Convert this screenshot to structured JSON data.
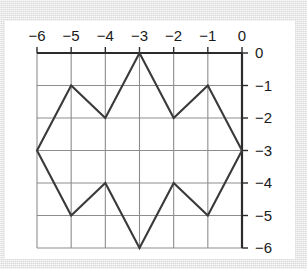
{
  "figure": {
    "background_color": "#ffffff",
    "page_background_color": "#e6e6e7",
    "grid_color": "#8d8d8d",
    "axis_color": "#2b2b2b",
    "polygon_color": "#3a3a3a"
  },
  "chart_data": {
    "type": "line",
    "title": "",
    "xlabel": "",
    "ylabel": "",
    "xlim": [
      -6,
      0
    ],
    "ylim": [
      -6,
      0
    ],
    "grid": true,
    "legend": null,
    "x_axis_position": "top",
    "y_axis_position": "right",
    "x_ticks": [
      -6,
      -5,
      -4,
      -3,
      -2,
      -1,
      0
    ],
    "x_tick_labels": [
      "−6",
      "−5",
      "−4",
      "−3",
      "−2",
      "−1",
      "0"
    ],
    "y_ticks": [
      0,
      -1,
      -2,
      -3,
      -4,
      -5,
      -6
    ],
    "y_tick_labels": [
      "0",
      "−1",
      "−2",
      "−3",
      "−4",
      "−5",
      "−6"
    ],
    "series": [
      {
        "name": "polygon",
        "closed": true,
        "points": [
          [
            -6,
            -3
          ],
          [
            -5,
            -1
          ],
          [
            -4,
            -2
          ],
          [
            -3,
            0
          ],
          [
            -2,
            -2
          ],
          [
            -1,
            -1
          ],
          [
            0,
            -3
          ],
          [
            -1,
            -5
          ],
          [
            -2,
            -4
          ],
          [
            -3,
            -6
          ],
          [
            -4,
            -4
          ],
          [
            -5,
            -5
          ]
        ]
      }
    ]
  },
  "labels": {
    "x": [
      "−6",
      "−5",
      "−4",
      "−3",
      "−2",
      "−1",
      "0"
    ],
    "y": [
      "0",
      "−1",
      "−2",
      "−3",
      "−4",
      "−5",
      "−6"
    ]
  }
}
